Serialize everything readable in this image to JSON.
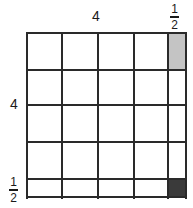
{
  "labels": {
    "top_whole": "4",
    "left_whole": "4",
    "top_fraction": {
      "numerator": "1",
      "denominator": "2"
    },
    "left_fraction": {
      "numerator": "1",
      "denominator": "2"
    }
  },
  "colors": {
    "line": "#2a2a2a",
    "light_shade": "#c4c4c4",
    "dark_shade": "#3a3a3a",
    "background": "#ffffff"
  },
  "grid": {
    "columns": [
      "1",
      "1",
      "1",
      "1",
      "1/2"
    ],
    "rows": [
      "1",
      "1",
      "1",
      "1",
      "1/2"
    ],
    "shaded_cells": [
      {
        "row": 0,
        "col": 4,
        "shade": "light"
      },
      {
        "row": 4,
        "col": 4,
        "shade": "dark"
      }
    ]
  }
}
